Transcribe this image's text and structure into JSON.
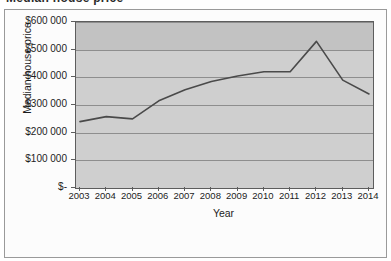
{
  "figure": {
    "cut_off_title": "Median house price",
    "plot_background": "#cfcfcf",
    "line_color": "#4a4a4a"
  },
  "chart_data": {
    "type": "line",
    "title": "",
    "xlabel": "Year",
    "ylabel": "Median house price",
    "categories": [
      "2003",
      "2004",
      "2005",
      "2006",
      "2007",
      "2008",
      "2009",
      "2010",
      "2011",
      "2012",
      "2013",
      "2014"
    ],
    "values": [
      240000,
      258000,
      250000,
      315000,
      355000,
      385000,
      405000,
      420000,
      420000,
      530000,
      390000,
      340000
    ],
    "series": [
      {
        "name": "Median house price",
        "values": [
          240000,
          258000,
          250000,
          315000,
          355000,
          385000,
          405000,
          420000,
          420000,
          530000,
          390000,
          340000
        ]
      }
    ],
    "ylim": [
      0,
      600000
    ],
    "ytick_values": [
      0,
      100000,
      200000,
      300000,
      400000,
      500000,
      600000
    ],
    "ytick_labels": [
      "$-",
      "$100 000",
      "$200 000",
      "$300 000",
      "$400 000",
      "$500 000",
      "$600 000"
    ],
    "grid": true,
    "legend": false,
    "legend_position": "none",
    "markers": false
  }
}
